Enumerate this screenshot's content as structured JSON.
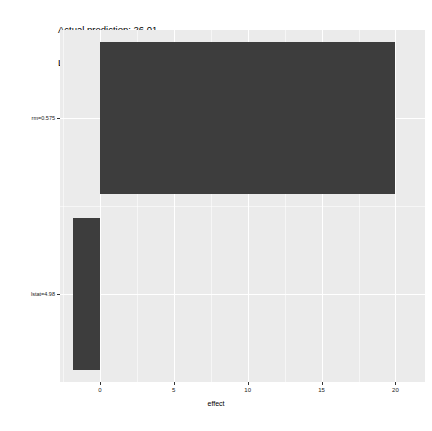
{
  "title": {
    "line1": "Actual prediction: 26.01",
    "line2": "LocalModel prediction: 26.04"
  },
  "chart_data": {
    "type": "bar",
    "orientation": "horizontal",
    "xlabel": "effect",
    "ylabel": "",
    "categories": [
      "rm=0.575",
      "lstat=4.98"
    ],
    "values": [
      20.0,
      -1.8
    ],
    "xlim": [
      -2.7,
      22.0
    ],
    "xticks": [
      0,
      5,
      10,
      15,
      20
    ],
    "xticklabels": [
      "0",
      "5",
      "10",
      "15",
      "20"
    ],
    "ytick_order_top_to_bottom": [
      "rm=0.575",
      "lstat=4.98"
    ],
    "grid": true,
    "legend": "none",
    "bar_color": "#3d3d3d",
    "panel_color": "#ebebeb",
    "gridline_color": "#ffffff",
    "annotations": [
      "Actual prediction: 26.01",
      "LocalModel prediction: 26.04"
    ]
  }
}
